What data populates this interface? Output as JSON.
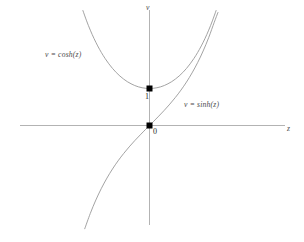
{
  "figure": {
    "background_color": "#ffffff",
    "width": 304,
    "height": 242
  },
  "axes": {
    "x_axis_label": "z",
    "y_axis_label": "v",
    "axis_color": "#b3b3b3",
    "origin_px": {
      "x": 149,
      "y": 125
    },
    "x_axis_span_px": {
      "from": 20,
      "to": 285
    },
    "y_axis_span_px": {
      "from": 10,
      "to": 225
    },
    "unit_px": 37
  },
  "labels": {
    "cosh_curve": "v = cosh(z)",
    "sinh_curve": "v = sinh(z)",
    "point_one": "1",
    "point_zero": "0"
  },
  "markers": [
    {
      "name": "cosh-minimum",
      "label": "1",
      "z": 0,
      "v": 1,
      "color": "#000000"
    },
    {
      "name": "origin",
      "label": "0",
      "z": 0,
      "v": 0,
      "color": "#000000"
    }
  ],
  "chart_data": {
    "type": "line",
    "title": "",
    "xlabel": "z",
    "ylabel": "v",
    "xlim": [
      -3.486,
      3.676
    ],
    "ylim": [
      -2.838,
      3.054
    ],
    "grid": false,
    "legend": "inline-annotations",
    "curve_color": "#999999",
    "series": [
      {
        "name": "v = cosh(z)",
        "label": "v = cosh(z)",
        "color": "#999999",
        "x": [
          -1.8,
          -1.7,
          -1.6,
          -1.5,
          -1.4,
          -1.3,
          -1.2,
          -1.1,
          -1.0,
          -0.9,
          -0.8,
          -0.7,
          -0.6,
          -0.5,
          -0.4,
          -0.3,
          -0.2,
          -0.1,
          0.0,
          0.1,
          0.2,
          0.3,
          0.4,
          0.5,
          0.6,
          0.7,
          0.8,
          0.9,
          1.0,
          1.1,
          1.2,
          1.3,
          1.4,
          1.5,
          1.6,
          1.7,
          1.8
        ],
        "y": [
          3.107,
          2.828,
          2.577,
          2.352,
          2.151,
          1.971,
          1.811,
          1.669,
          1.543,
          1.433,
          1.337,
          1.255,
          1.185,
          1.128,
          1.081,
          1.045,
          1.02,
          1.005,
          1.0,
          1.005,
          1.02,
          1.045,
          1.081,
          1.128,
          1.185,
          1.255,
          1.337,
          1.433,
          1.543,
          1.669,
          1.811,
          1.971,
          2.151,
          2.352,
          2.577,
          2.828,
          3.107
        ]
      },
      {
        "name": "v = sinh(z)",
        "label": "v = sinh(z)",
        "color": "#999999",
        "x": [
          -1.75,
          -1.6,
          -1.45,
          -1.3,
          -1.15,
          -1.0,
          -0.85,
          -0.7,
          -0.55,
          -0.4,
          -0.25,
          -0.1,
          0.0,
          0.1,
          0.25,
          0.4,
          0.55,
          0.7,
          0.85,
          1.0,
          1.15,
          1.3,
          1.45,
          1.6,
          1.75,
          1.85
        ],
        "y": [
          -2.79,
          -2.376,
          -2.014,
          -1.698,
          -1.421,
          -1.175,
          -0.956,
          -0.759,
          -0.579,
          -0.411,
          -0.253,
          -0.1,
          0.0,
          0.1,
          0.253,
          0.411,
          0.579,
          0.759,
          0.956,
          1.175,
          1.421,
          1.698,
          2.014,
          2.376,
          2.79,
          3.054
        ]
      }
    ],
    "annotations": [
      {
        "text": "v = cosh(z)",
        "z": -2.8,
        "v": 1.89
      },
      {
        "text": "v = sinh(z)",
        "z": 0.95,
        "v": 0.51
      },
      {
        "text": "1",
        "z": -0.11,
        "v": 0.78
      },
      {
        "text": "0",
        "z": 0.11,
        "v": -0.19
      }
    ]
  }
}
